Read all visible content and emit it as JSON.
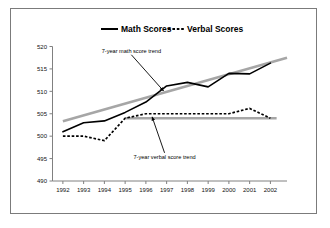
{
  "figure": {
    "background_color": "#ffffff",
    "frame_color": "#7b7b7b",
    "axis_color": "#808080",
    "series_color": "#000000",
    "trend_color": "#a6a6a6"
  },
  "legend": {
    "position": "top-center",
    "entries": [
      {
        "label": "Math Scores",
        "style": "solid",
        "icon": "solid-line-swatch"
      },
      {
        "label": "Verbal Scores",
        "style": "dashed",
        "icon": "dashed-line-swatch"
      }
    ]
  },
  "annotations": [
    {
      "id": "math-trend",
      "text": "7-year math score trend"
    },
    {
      "id": "verbal-trend",
      "text": "7-year verbal score trend"
    }
  ],
  "chart_data": {
    "type": "line",
    "title": "",
    "subtitle": "",
    "xlabel": "",
    "ylabel": "",
    "grid": false,
    "legend_position": "top-center",
    "x": [
      1992,
      1993,
      1994,
      1995,
      1996,
      1997,
      1998,
      1999,
      2000,
      2001,
      2002
    ],
    "categories": [
      "1992",
      "1993",
      "1994",
      "1995",
      "1996",
      "1997",
      "1998",
      "1999",
      "2000",
      "2001",
      "2002"
    ],
    "xlim": [
      1991.5,
      2002.8
    ],
    "ylim": [
      490,
      520
    ],
    "yticks": [
      490,
      495,
      500,
      505,
      510,
      515,
      520
    ],
    "ytick_labels": [
      "490",
      "495",
      "500",
      "505",
      "510",
      "515",
      "520"
    ],
    "series": [
      {
        "name": "Math Scores",
        "style": "solid",
        "color": "#000000",
        "values": [
          501,
          503,
          503.4,
          505.3,
          507.6,
          511.2,
          512,
          511,
          514,
          513.9,
          516.3
        ]
      },
      {
        "name": "Verbal Scores",
        "style": "dashed",
        "color": "#000000",
        "values": [
          500,
          500,
          499,
          504,
          505,
          505,
          505,
          505,
          505,
          506.2,
          504
        ]
      }
    ],
    "trend_lines": [
      {
        "name": "7-year math score trend",
        "color": "#a6a6a6",
        "x_start": 1992,
        "x_end": 2002.8,
        "y_start": 503.3,
        "y_end": 517.5
      },
      {
        "name": "7-year verbal score trend",
        "color": "#a6a6a6",
        "x_start": 1995,
        "x_end": 2002.3,
        "y_start": 504,
        "y_end": 504
      }
    ],
    "annotations": [
      {
        "text": "7-year math score trend",
        "text_x": 1995.3,
        "text_y": 518.6,
        "arrow_to_x": 1996.85,
        "arrow_to_y": 510.1
      },
      {
        "text": "7-year verbal score trend",
        "text_x": 1996.9,
        "text_y": 494.9,
        "arrow_to_x": 1996.3,
        "arrow_to_y": 504.3
      }
    ]
  }
}
